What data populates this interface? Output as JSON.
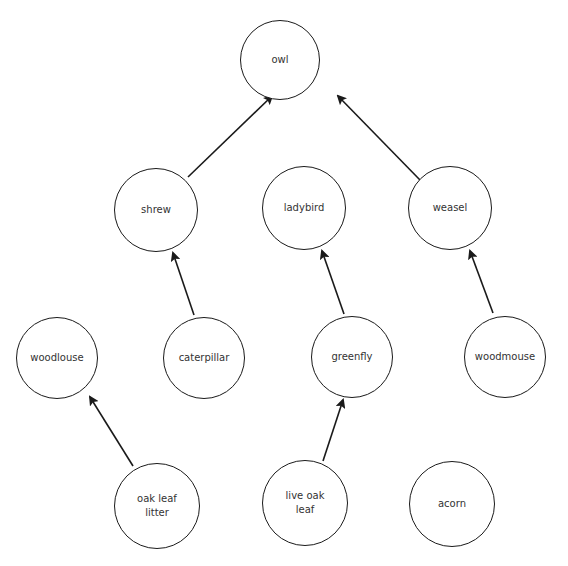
{
  "diagram": {
    "type": "food-web",
    "colors": {
      "stroke": "#1a1a1a",
      "text": "#333333",
      "background": "#ffffff"
    },
    "nodes": [
      {
        "id": "owl",
        "label": "owl",
        "cx": 280,
        "cy": 60,
        "r": 40
      },
      {
        "id": "shrew",
        "label": "shrew",
        "cx": 156,
        "cy": 210,
        "r": 42
      },
      {
        "id": "ladybird",
        "label": "ladybird",
        "cx": 304,
        "cy": 208,
        "r": 42
      },
      {
        "id": "weasel",
        "label": "weasel",
        "cx": 450,
        "cy": 208,
        "r": 42
      },
      {
        "id": "woodlouse",
        "label": "woodlouse",
        "cx": 57,
        "cy": 358,
        "r": 41
      },
      {
        "id": "caterpillar",
        "label": "caterpillar",
        "cx": 204,
        "cy": 358,
        "r": 41
      },
      {
        "id": "greenfly",
        "label": "greenfly",
        "cx": 352,
        "cy": 357,
        "r": 41
      },
      {
        "id": "woodmouse",
        "label": "woodmouse",
        "cx": 505,
        "cy": 357,
        "r": 41
      },
      {
        "id": "oak-leaf-litter",
        "label": "oak leaf\nlitter",
        "cx": 157,
        "cy": 506,
        "r": 43
      },
      {
        "id": "live-oak-leaf",
        "label": "live oak\nleaf",
        "cx": 305,
        "cy": 503,
        "r": 43
      },
      {
        "id": "acorn",
        "label": "acorn",
        "cx": 452,
        "cy": 504,
        "r": 43
      }
    ],
    "edges": [
      {
        "from": "shrew",
        "to": "owl",
        "x1": 188,
        "y1": 177,
        "x2": 272,
        "y2": 96
      },
      {
        "from": "weasel",
        "to": "owl",
        "x1": 420,
        "y1": 180,
        "x2": 338,
        "y2": 96
      },
      {
        "from": "caterpillar",
        "to": "shrew",
        "x1": 194,
        "y1": 315,
        "x2": 173,
        "y2": 253
      },
      {
        "from": "greenfly",
        "to": "ladybird",
        "x1": 344,
        "y1": 314,
        "x2": 322,
        "y2": 251
      },
      {
        "from": "woodmouse",
        "to": "weasel",
        "x1": 493,
        "y1": 313,
        "x2": 470,
        "y2": 251
      },
      {
        "from": "oak-leaf-litter",
        "to": "woodlouse",
        "x1": 133,
        "y1": 466,
        "x2": 90,
        "y2": 397
      },
      {
        "from": "live-oak-leaf",
        "to": "greenfly",
        "x1": 323,
        "y1": 461,
        "x2": 343,
        "y2": 400
      }
    ]
  }
}
